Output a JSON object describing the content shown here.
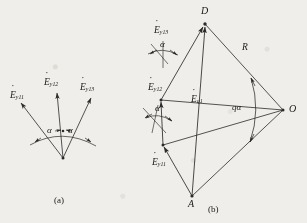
{
  "figure": {
    "panels": [
      {
        "id": "a",
        "caption": "(a)",
        "description": "Three EMF phasors radiating from a common point separated by slot angle alpha",
        "labels": {
          "phasor1": "E",
          "phasor1_sub": "y11",
          "phasor2": "E",
          "phasor2_sub": "y12",
          "phasor3": "E",
          "phasor3_sub": "y13",
          "angle1": "α",
          "angle2": "α"
        }
      },
      {
        "id": "b",
        "caption": "(b)",
        "description": "Polygon of phasor addition inscribed in a circle of radius R centred at O, resultant E q1 from A to D subtending central angle q alpha",
        "labels": {
          "phasor1": "E",
          "phasor1_sub": "y11",
          "phasor2": "E",
          "phasor2_sub": "y12",
          "phasor3": "E",
          "phasor3_sub": "y13",
          "resultant": "E",
          "resultant_sub": "q1",
          "radius": "R",
          "central_angle": "qα",
          "angle1": "α",
          "angle2": "α",
          "vertex_top": "D",
          "vertex_bottom": "A",
          "centre": "O"
        }
      }
    ],
    "style": {
      "line_color": "#2a2a2a",
      "background": "#efeeea",
      "text_color": "#1b1b1b"
    }
  }
}
